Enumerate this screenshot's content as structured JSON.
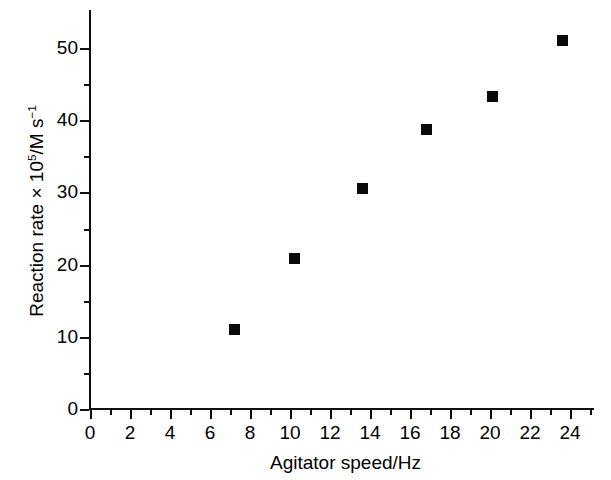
{
  "chart_data": {
    "type": "scatter",
    "title": "",
    "xlabel": "Agitator speed/Hz",
    "ylabel": "Reaction rate × 10⁵/M s⁻¹",
    "ylabel_parts": {
      "lead": "Reaction rate × 10",
      "exp1": "5",
      "mid": "/M s",
      "exp2": "−1"
    },
    "xlim": [
      0,
      25.2
    ],
    "ylim": [
      0,
      55.2
    ],
    "xticks": [
      0,
      2,
      4,
      6,
      8,
      10,
      12,
      14,
      16,
      18,
      20,
      22,
      24
    ],
    "xtick_labels": [
      "0",
      "2",
      "4",
      "6",
      "8",
      "10",
      "12",
      "14",
      "16",
      "18",
      "20",
      "22",
      "24"
    ],
    "xminor_ticks": [
      1,
      3,
      5,
      7,
      9,
      11,
      13,
      15,
      17,
      19,
      21,
      23,
      25
    ],
    "yticks": [
      0,
      10,
      20,
      30,
      40,
      50
    ],
    "ytick_labels": [
      "0",
      "10",
      "20",
      "30",
      "40",
      "50"
    ],
    "yminor_ticks": [
      5,
      15,
      25,
      35,
      45,
      55
    ],
    "grid": false,
    "legend": null,
    "marker": "filled-square",
    "marker_color": "#0a0a0a",
    "x": [
      7.2,
      10.2,
      13.6,
      16.8,
      20.1,
      23.6
    ],
    "y": [
      11.0,
      20.8,
      30.6,
      38.7,
      43.3,
      51.1
    ],
    "points": [
      {
        "x": 7.2,
        "y": 11.0
      },
      {
        "x": 10.2,
        "y": 20.8
      },
      {
        "x": 13.6,
        "y": 30.6
      },
      {
        "x": 16.8,
        "y": 38.7
      },
      {
        "x": 20.1,
        "y": 43.3
      },
      {
        "x": 23.6,
        "y": 51.1
      }
    ]
  }
}
